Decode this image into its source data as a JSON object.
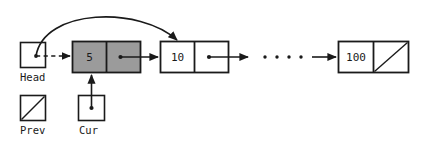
{
  "diagram": {
    "colors": {
      "stroke": "#1a1a1a",
      "text": "#1a1a1a",
      "node_fill_plain": "#ffffff",
      "node_fill_highlight": "#9b9b9b",
      "background": "#ffffff"
    },
    "pointer_boxes": [
      {
        "id": "head",
        "label": "Head",
        "null_slash": false,
        "has_dot": true
      },
      {
        "id": "prev",
        "label": "Prev",
        "null_slash": true,
        "has_dot": false
      },
      {
        "id": "cur",
        "label": "Cur",
        "null_slash": false,
        "has_dot": true
      }
    ],
    "nodes": [
      {
        "id": "node-5",
        "value": "5",
        "highlighted": true,
        "next_null": false,
        "has_next_dot": true
      },
      {
        "id": "node-10",
        "value": "10",
        "highlighted": false,
        "next_null": false,
        "has_next_dot": true
      },
      {
        "id": "node-100",
        "value": "100",
        "highlighted": false,
        "next_null": true,
        "has_next_dot": false
      }
    ],
    "ellipsis": "• • • •",
    "edges": [
      {
        "id": "head-to-node5",
        "style": "dashed",
        "from": "head",
        "to": "node-5"
      },
      {
        "id": "head-curved-to-node10",
        "style": "curved",
        "from": "head",
        "to": "node-10"
      },
      {
        "id": "node5-to-node10",
        "style": "solid",
        "from": "node-5",
        "to": "node-10"
      },
      {
        "id": "node10-to-ellipsis",
        "style": "solid",
        "from": "node-10",
        "to": "ellipsis"
      },
      {
        "id": "ellipsis-to-node100",
        "style": "solid",
        "from": "ellipsis",
        "to": "node-100"
      },
      {
        "id": "cur-to-node5",
        "style": "solid-up",
        "from": "cur",
        "to": "node-5"
      }
    ]
  }
}
